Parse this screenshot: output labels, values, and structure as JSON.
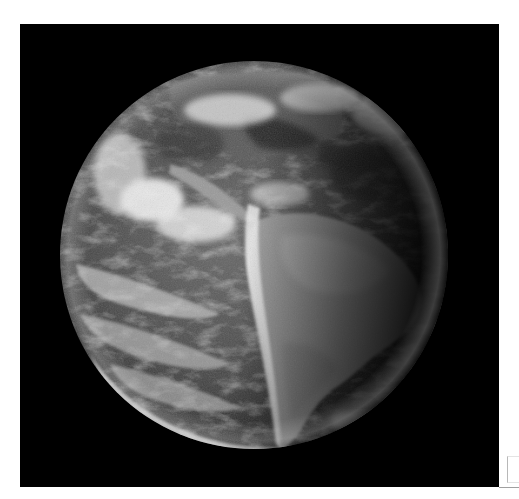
{
  "image": {
    "subject": "Full-disk satellite view of Earth centered on South America",
    "color_mode": "grayscale",
    "frame_background": "#000000",
    "page_background": "#ffffff"
  },
  "globe": {
    "center_x": 234,
    "center_y": 231,
    "radius": 194,
    "features": [
      "south-america",
      "central-america",
      "north-america-southern",
      "atlantic-cloud-bands",
      "pacific-cloud-bands",
      "polar-front-cloud-arc",
      "terminator-shadow-east"
    ]
  }
}
